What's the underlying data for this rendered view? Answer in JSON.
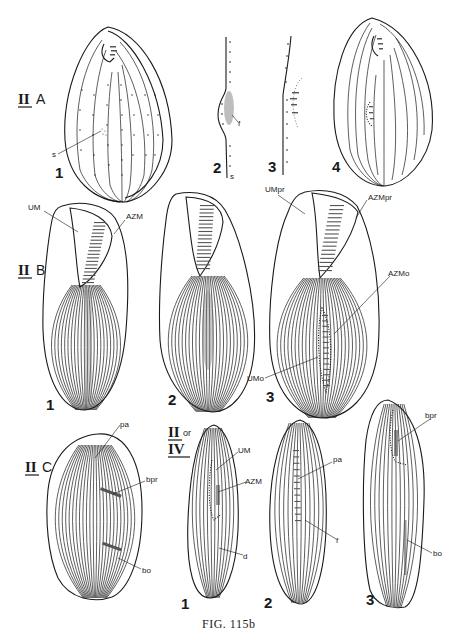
{
  "figure": {
    "caption": "FIG. 115b",
    "ink_color": "#1a1a1a",
    "background_color": "#ffffff"
  },
  "sections": [
    {
      "id": "IIA",
      "roman": "II",
      "letter": "A",
      "panels": [
        {
          "number": "1",
          "labels": [
            "s"
          ]
        },
        {
          "number": "2",
          "labels": [
            "f",
            "s"
          ]
        },
        {
          "number": "3",
          "labels": []
        },
        {
          "number": "4",
          "labels": []
        }
      ]
    },
    {
      "id": "IIB",
      "roman": "II",
      "letter": "B",
      "panels": [
        {
          "number": "1",
          "labels": [
            "UM",
            "AZM"
          ]
        },
        {
          "number": "2",
          "labels": []
        },
        {
          "number": "3",
          "labels": [
            "UMpr",
            "AZMpr",
            "AZMo",
            "UMo"
          ]
        }
      ]
    },
    {
      "id": "IIC",
      "roman": "II",
      "letter": "C",
      "panels": [
        {
          "number": "",
          "labels": [
            "pa",
            "bpr",
            "bo"
          ]
        }
      ]
    },
    {
      "id": "IIorIV",
      "roman": "II",
      "connector": "or",
      "roman2": "IV",
      "panels": [
        {
          "number": "1",
          "labels": [
            "UM",
            "AZM",
            "d"
          ]
        },
        {
          "number": "2",
          "labels": [
            "pa",
            "f"
          ]
        },
        {
          "number": "3",
          "labels": [
            "bpr",
            "bo"
          ]
        }
      ]
    }
  ],
  "labels": {
    "IIA_1_s": "s",
    "IIA_2_f": "f",
    "IIA_2_s": "s",
    "IIB_1_UM": "UM",
    "IIB_1_AZM": "AZM",
    "IIB_3_UMpr": "UMpr",
    "IIB_3_AZMpr": "AZMpr",
    "IIB_3_AZMo": "AZMo",
    "IIB_3_UMo": "UMo",
    "IIC_pa": "pa",
    "IIC_bpr": "bpr",
    "IIC_bo": "bo",
    "IV_1_UM": "UM",
    "IV_1_AZM": "AZM",
    "IV_1_d": "d",
    "IV_2_pa": "pa",
    "IV_2_f": "f",
    "IV_3_bpr": "bpr",
    "IV_3_bo": "bo"
  },
  "section_labels": {
    "IIA_roman": "II",
    "IIA_letter": "A",
    "IIB_roman": "II",
    "IIB_letter": "B",
    "IIC_roman": "II",
    "IIC_letter": "C",
    "IV_roman1": "II",
    "IV_or": "or",
    "IV_roman2": "IV"
  },
  "panel_numbers": {
    "IIA_1": "1",
    "IIA_2": "2",
    "IIA_3": "3",
    "IIA_4": "4",
    "IIB_1": "1",
    "IIB_2": "2",
    "IIB_3": "3",
    "IV_1": "1",
    "IV_2": "2",
    "IV_3": "3"
  }
}
